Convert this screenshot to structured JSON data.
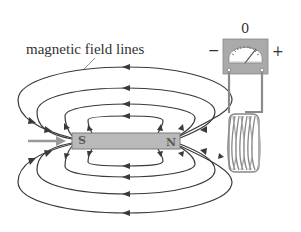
{
  "diagram": {
    "title_label": "magnetic field lines",
    "magnet": {
      "left_pole": "S",
      "right_pole": "N",
      "fill": "#b8b8b8",
      "stroke": "#7a7a7a"
    },
    "meter": {
      "zero_label": "0",
      "minus_label": "−",
      "plus_label": "+"
    },
    "motion_arrow": "pushing magnet toward coil",
    "colors": {
      "field_line": "#3a3a3a",
      "wire": "#8a8a8a",
      "text": "#333333",
      "background": "#ffffff"
    }
  }
}
